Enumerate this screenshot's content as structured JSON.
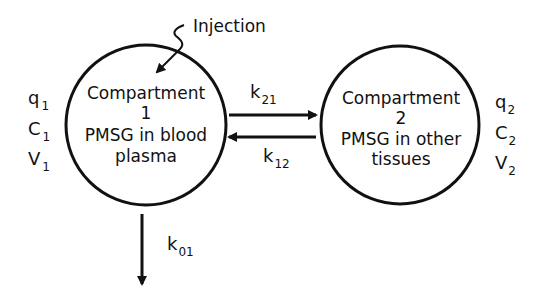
{
  "diagram": {
    "type": "two-compartment pharmacokinetic model",
    "injection_label": "Injection",
    "compartments": [
      {
        "id": 1,
        "title": "Compartment",
        "number": "1",
        "line1": "PMSG in blood",
        "line2": "plasma",
        "variables": [
          {
            "base": "q",
            "sub": "1"
          },
          {
            "base": "C",
            "sub": "1"
          },
          {
            "base": "V",
            "sub": "1"
          }
        ]
      },
      {
        "id": 2,
        "title": "Compartment",
        "number": "2",
        "line1": "PMSG in other",
        "line2": "tissues",
        "variables": [
          {
            "base": "q",
            "sub": "2"
          },
          {
            "base": "C",
            "sub": "2"
          },
          {
            "base": "V",
            "sub": "2"
          }
        ]
      }
    ],
    "rates": [
      {
        "base": "k",
        "sub": "21",
        "from": "Compartment 1",
        "to": "Compartment 2"
      },
      {
        "base": "k",
        "sub": "12",
        "from": "Compartment 2",
        "to": "Compartment 1"
      },
      {
        "base": "k",
        "sub": "01",
        "from": "Compartment 1",
        "to": "elimination"
      }
    ],
    "colors": {
      "ink": "#111111",
      "background": "#ffffff"
    }
  }
}
